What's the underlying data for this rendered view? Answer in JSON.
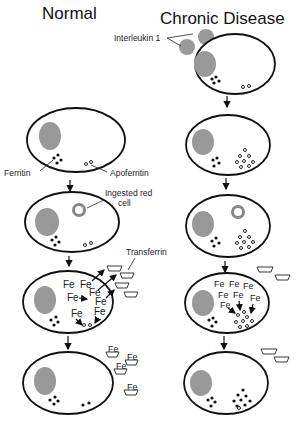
{
  "titles": {
    "normal": "Normal",
    "chronic": "Chronic Disease"
  },
  "labels": {
    "interleukin": "Interleukin 1",
    "ferritin": "Ferritin",
    "apoferritin": "Apoferritin",
    "ingested_line1": "Ingested red",
    "ingested_line2": "cell",
    "transferrin": "Transferrin",
    "fe": "Fe"
  },
  "icons": {
    "arrow_down": "down-arrow",
    "nucleus": "nucleus",
    "ferritin_dot": "filled-circle",
    "apoferritin_ring": "open-circle",
    "transferrin_cup": "cup-shape",
    "red_cell": "ring-donut"
  },
  "colors": {
    "nucleus": "#999999",
    "outline": "#111111",
    "background": "#ffffff"
  }
}
